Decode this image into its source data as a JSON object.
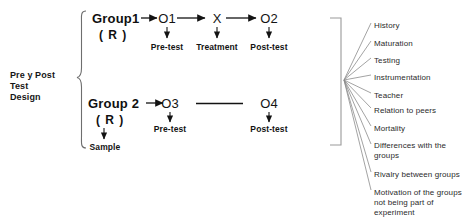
{
  "diagram": {
    "title_label": "Pre y Post Test Design",
    "title_lines": [
      "Pre y Post",
      "Test",
      "Design"
    ],
    "groups": [
      {
        "name": "Group1",
        "randomization": "( R )",
        "steps": [
          {
            "token": "O1",
            "caption": "Pre-test"
          },
          {
            "token": "X",
            "caption": "Treatment"
          },
          {
            "token": "O2",
            "caption": "Post-test"
          }
        ]
      },
      {
        "name": "Group 2",
        "randomization": "( R )",
        "randomization_caption": "Sample",
        "steps": [
          {
            "token": "O3",
            "caption": "Pre-test"
          },
          {
            "token": "",
            "caption": ""
          },
          {
            "token": "O4",
            "caption": "Post-test"
          }
        ]
      }
    ],
    "threats": [
      {
        "lines": [
          "History"
        ]
      },
      {
        "lines": [
          "Maturation"
        ]
      },
      {
        "lines": [
          "Testing"
        ]
      },
      {
        "lines": [
          "Instrumentation"
        ]
      },
      {
        "lines": [
          "Teacher"
        ]
      },
      {
        "lines": [
          "Relation to peers"
        ]
      },
      {
        "lines": [
          "Mortality"
        ]
      },
      {
        "lines": [
          "Differences with the",
          "groups"
        ]
      },
      {
        "lines": [
          "Rivalry between groups"
        ]
      },
      {
        "lines": [
          "Motivation of the groups",
          "not being part of",
          "experiment"
        ]
      }
    ],
    "colors": {
      "background": "#ffffff",
      "text": "#141414",
      "muted_text": "#2b2b2b",
      "rule": "#1a1a1a",
      "fan_line": "#777777",
      "bracket": "#8a8a8a"
    }
  }
}
